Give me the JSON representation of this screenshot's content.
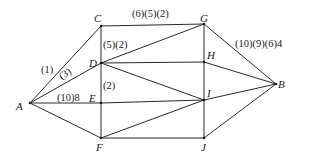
{
  "diagram": {
    "type": "network-graph",
    "nodes": [
      {
        "id": "A",
        "label": "A",
        "x": 30,
        "y": 103,
        "lx": 16,
        "ly": 110
      },
      {
        "id": "C",
        "label": "C",
        "x": 101,
        "y": 26,
        "lx": 94,
        "ly": 22
      },
      {
        "id": "D",
        "label": "D",
        "x": 101,
        "y": 63,
        "lx": 89,
        "ly": 67
      },
      {
        "id": "E",
        "label": "E",
        "x": 101,
        "y": 103,
        "lx": 89,
        "ly": 102
      },
      {
        "id": "F",
        "label": "F",
        "x": 101,
        "y": 138,
        "lx": 96,
        "ly": 151
      },
      {
        "id": "G",
        "label": "G",
        "x": 204,
        "y": 24,
        "lx": 200,
        "ly": 22
      },
      {
        "id": "H",
        "label": "H",
        "x": 204,
        "y": 62,
        "lx": 207,
        "ly": 59
      },
      {
        "id": "I",
        "label": "I",
        "x": 204,
        "y": 100,
        "lx": 207,
        "ly": 97
      },
      {
        "id": "J",
        "label": "J",
        "x": 204,
        "y": 138,
        "lx": 201,
        "ly": 151
      },
      {
        "id": "B",
        "label": "B",
        "x": 276,
        "y": 84,
        "lx": 278,
        "ly": 88
      }
    ],
    "edges": [
      {
        "from": "A",
        "to": "C"
      },
      {
        "from": "A",
        "to": "D"
      },
      {
        "from": "A",
        "to": "E"
      },
      {
        "from": "A",
        "to": "F"
      },
      {
        "from": "C",
        "to": "G"
      },
      {
        "from": "C",
        "to": "D"
      },
      {
        "from": "D",
        "to": "E"
      },
      {
        "from": "E",
        "to": "F"
      },
      {
        "from": "D",
        "to": "G"
      },
      {
        "from": "D",
        "to": "H"
      },
      {
        "from": "D",
        "to": "I"
      },
      {
        "from": "E",
        "to": "I"
      },
      {
        "from": "F",
        "to": "I"
      },
      {
        "from": "F",
        "to": "J"
      },
      {
        "from": "G",
        "to": "H"
      },
      {
        "from": "H",
        "to": "I"
      },
      {
        "from": "I",
        "to": "J"
      },
      {
        "from": "G",
        "to": "B"
      },
      {
        "from": "H",
        "to": "B"
      },
      {
        "from": "I",
        "to": "B"
      },
      {
        "from": "J",
        "to": "B"
      }
    ],
    "edge_labels": [
      {
        "text": "(1)",
        "x": 41,
        "y": 73
      },
      {
        "text": "(3)",
        "x": 62,
        "y": 80,
        "rotate": -35
      },
      {
        "text": "(10)8",
        "x": 57,
        "y": 101
      },
      {
        "text": "(5)(2)",
        "x": 103,
        "y": 48
      },
      {
        "text": "(2)",
        "x": 103,
        "y": 89
      },
      {
        "text": "(6)(5)(2)",
        "x": 132,
        "y": 17
      },
      {
        "text": "(10)(9)(6)4",
        "x": 235,
        "y": 47
      }
    ]
  }
}
